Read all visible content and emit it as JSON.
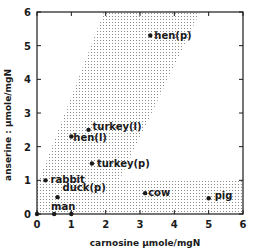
{
  "chart_data": {
    "type": "scatter",
    "title": "",
    "xlabel": "carnosine µmole/mgN",
    "ylabel": "anserine : µmole/mgN",
    "xlim": [
      0,
      6
    ],
    "ylim": [
      0,
      6
    ],
    "xticks": [
      "0",
      "1",
      "2",
      "3",
      "4",
      "5",
      "6"
    ],
    "yticks": [
      "0",
      "1",
      "2",
      "3",
      "4",
      "5",
      "6"
    ],
    "grid": false,
    "legend": null,
    "points": [
      {
        "label": "hen(p)",
        "x": 3.3,
        "y": 5.3
      },
      {
        "label": "turkey(l)",
        "x": 1.5,
        "y": 2.5
      },
      {
        "label": "hen(l)",
        "x": 1.0,
        "y": 2.3
      },
      {
        "label": "turkey(p)",
        "x": 1.6,
        "y": 1.5
      },
      {
        "label": "rabbit",
        "x": 0.25,
        "y": 1.0
      },
      {
        "label": "duck(p)",
        "x": 0.6,
        "y": 0.5
      },
      {
        "label": "cow",
        "x": 3.15,
        "y": 0.62
      },
      {
        "label": "pig",
        "x": 5.0,
        "y": 0.47
      },
      {
        "label": "man",
        "x": 0.0,
        "y": 0.0
      },
      {
        "label": "",
        "x": 0.5,
        "y": 0.0
      },
      {
        "label": "",
        "x": 1.0,
        "y": 0.0
      }
    ],
    "shaded_regions": [
      {
        "name": "diagonal-band",
        "polygon": [
          [
            0,
            0.85
          ],
          [
            1.95,
            6
          ],
          [
            4.75,
            6
          ],
          [
            2.4,
            1.0
          ],
          [
            0,
            1.0
          ]
        ]
      },
      {
        "name": "horizontal-band",
        "polygon": [
          [
            0,
            0
          ],
          [
            6,
            0
          ],
          [
            6,
            1.0
          ],
          [
            0,
            1.0
          ]
        ]
      }
    ]
  },
  "colors": {
    "ink": "#1a1a1a",
    "shade": "#9a9a9a",
    "background": "#ffffff"
  }
}
